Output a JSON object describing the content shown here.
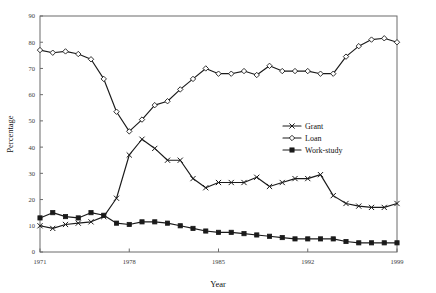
{
  "chart_data": {
    "type": "line",
    "title": "",
    "xlabel": "Year",
    "ylabel": "Percentage",
    "xlim": [
      1971,
      1999
    ],
    "ylim": [
      0,
      90
    ],
    "grid": false,
    "legend_position": "center-right",
    "xticks": [
      "1971",
      "1978",
      "1985",
      "1992",
      "1999"
    ],
    "xtick_values": [
      1971,
      1978,
      1985,
      1992,
      1999
    ],
    "yticks": [
      "0",
      "10",
      "20",
      "30",
      "40",
      "50",
      "60",
      "70",
      "80",
      "90"
    ],
    "ytick_values": [
      0,
      10,
      20,
      30,
      40,
      50,
      60,
      70,
      80,
      90
    ],
    "x": [
      1971,
      1972,
      1973,
      1974,
      1975,
      1976,
      1977,
      1978,
      1979,
      1980,
      1981,
      1982,
      1983,
      1984,
      1985,
      1986,
      1987,
      1988,
      1989,
      1990,
      1991,
      1992,
      1993,
      1994,
      1995,
      1996,
      1997,
      1998,
      1999
    ],
    "series": [
      {
        "name": "Grant",
        "marker": "x",
        "values": [
          10.0,
          9.0,
          10.5,
          11.0,
          11.5,
          13.5,
          20.5,
          37.0,
          43.0,
          39.5,
          35.0,
          35.0,
          28.0,
          24.5,
          26.5,
          26.5,
          26.5,
          28.5,
          25.0,
          26.5,
          28.0,
          28.0,
          29.5,
          21.5,
          18.5,
          17.5,
          17.0,
          17.0,
          18.5
        ]
      },
      {
        "name": "Loan",
        "marker": "diamond",
        "values": [
          77.0,
          76.0,
          76.5,
          75.5,
          73.5,
          66.0,
          53.5,
          46.0,
          50.5,
          56.0,
          57.5,
          62.0,
          66.0,
          70.0,
          68.0,
          68.0,
          69.0,
          67.5,
          71.0,
          69.0,
          69.0,
          69.0,
          68.0,
          68.0,
          74.5,
          78.5,
          81.0,
          81.5,
          80.0
        ]
      },
      {
        "name": "Work-study",
        "marker": "square",
        "values": [
          13.0,
          15.0,
          13.5,
          13.0,
          15.0,
          14.0,
          11.0,
          10.5,
          11.5,
          11.5,
          11.0,
          10.0,
          9.0,
          8.0,
          7.5,
          7.5,
          7.0,
          6.5,
          6.0,
          5.5,
          5.0,
          5.0,
          5.0,
          5.0,
          4.0,
          3.5,
          3.5,
          3.5,
          3.5
        ]
      }
    ]
  },
  "legend": {
    "items": [
      {
        "label": "Grant",
        "marker": "x"
      },
      {
        "label": "Loan",
        "marker": "diamond"
      },
      {
        "label": "Work-study",
        "marker": "square"
      }
    ]
  }
}
